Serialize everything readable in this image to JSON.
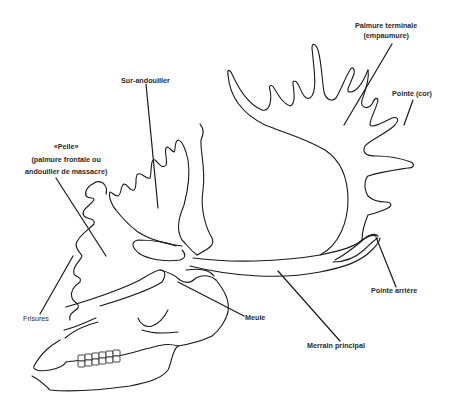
{
  "figure": {
    "background": "#ffffff",
    "line_color": "#1a1a1a"
  },
  "labels": {
    "palmure_terminale": {
      "line1": "Palmure terminale",
      "line2": "(empaumure)"
    },
    "pointe_cor": {
      "text": "Pointe (cor)"
    },
    "sur_andouiller": {
      "text": "Sur-andouiller"
    },
    "pelle": {
      "line1": "«Pelle»",
      "line2": "(palmure frontale ou",
      "line3": "andouiller de massacre)"
    },
    "frisures": {
      "text": "Frisures"
    },
    "meule": {
      "text": "Meule"
    },
    "merrain_principal": {
      "text": "Merrain principal"
    },
    "pointe_arriere": {
      "text": "Pointe arrière"
    }
  }
}
